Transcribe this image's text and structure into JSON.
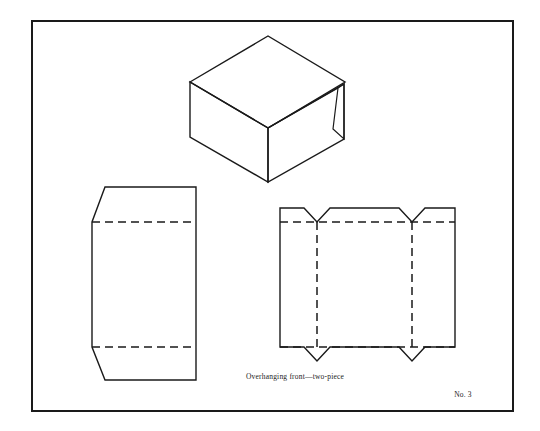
{
  "plate": {
    "caption": "Overhanging front—two-piece",
    "number_label": "No. 3",
    "ink_color": "#1a1a1a",
    "paper_color": "#ffffff",
    "border": {
      "x": 32,
      "y": 21,
      "width": 481,
      "height": 390
    }
  },
  "figures": {
    "perspective": {
      "name": "overhanging-front-box-perspective",
      "top_face": "190,82 268,36 345,82 268,128",
      "left_face": "190,82 190,137 268,182 268,128",
      "front_face": "268,128 268,182 344,139 344,84",
      "overhang_sliver": "338,88 344,84 344,139 333,129",
      "inner_edge": "268,128 338,88"
    },
    "cover_blank": {
      "name": "two-piece-cover-blank",
      "outline": "105,187 196,187 196,380 105,380 92,347 92,222",
      "fold_lines": [
        {
          "x1": 92,
          "y1": 222,
          "x2": 196,
          "y2": 222
        },
        {
          "x1": 92,
          "y1": 347,
          "x2": 196,
          "y2": 347
        }
      ]
    },
    "tray_blank": {
      "name": "overhanging-front-tray-blank",
      "outline": "280,208 304,208 317,222 330,208 399,208 412,222 425,208 455,208 455,347 425,347 412,361 399,347 330,347 317,361 304,347 280,347",
      "horizontal_folds": [
        {
          "x1": 280,
          "y1": 222,
          "x2": 455,
          "y2": 222
        },
        {
          "x1": 280,
          "y1": 347,
          "x2": 455,
          "y2": 347
        }
      ],
      "vertical_folds": [
        {
          "x1": 317,
          "y1": 222,
          "x2": 317,
          "y2": 347
        },
        {
          "x1": 412,
          "y1": 222,
          "x2": 412,
          "y2": 347
        }
      ]
    }
  },
  "labels": {
    "caption_position": {
      "x": 295,
      "y": 379
    },
    "number_position": {
      "x": 463,
      "y": 397
    }
  }
}
